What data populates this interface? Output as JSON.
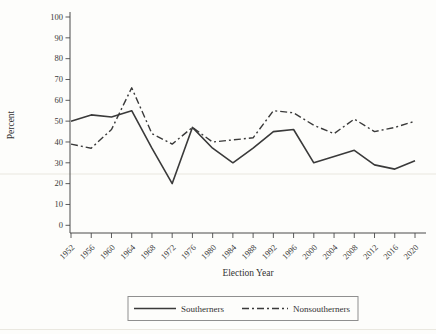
{
  "figure": {
    "background_color": "#fdfdfb",
    "line_color": "#3a3a3a",
    "axis_color": "#4a4a4a",
    "text_color": "#333333",
    "legend_border_color": "#8f8f8f"
  },
  "chart_data": {
    "type": "line",
    "title": "",
    "xlabel": "Election Year",
    "ylabel": "Percent",
    "xlim": [
      1952,
      2020
    ],
    "ylim": [
      0,
      100
    ],
    "yticks": [
      0,
      10,
      20,
      30,
      40,
      50,
      60,
      70,
      80,
      90,
      100
    ],
    "grid": false,
    "legend_position": "bottom-center",
    "x": [
      1952,
      1956,
      1960,
      1964,
      1968,
      1972,
      1976,
      1980,
      1984,
      1988,
      1992,
      1996,
      2000,
      2004,
      2008,
      2012,
      2016,
      2020
    ],
    "series": [
      {
        "name": "Southerners",
        "style": "solid",
        "values": [
          50,
          53,
          52,
          55,
          37,
          20,
          47,
          37,
          30,
          37,
          45,
          46,
          30,
          33,
          36,
          29,
          27,
          31
        ]
      },
      {
        "name": "Nonsoutherners",
        "style": "dash-dot",
        "values": [
          39,
          37,
          46,
          66,
          44,
          39,
          47,
          40,
          41,
          42,
          55,
          54,
          48,
          44,
          51,
          45,
          47,
          50
        ]
      }
    ]
  }
}
